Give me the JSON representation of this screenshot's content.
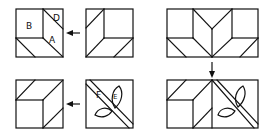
{
  "diagram": {
    "colors": {
      "line": "#111111",
      "background": "#ffffff"
    },
    "labels": {
      "B": "B",
      "D": "D",
      "A": "A",
      "F": "F",
      "E": "E"
    },
    "panels": [
      {
        "id": "top-left",
        "labels": [
          "B",
          "D",
          "A"
        ]
      },
      {
        "id": "top-middle",
        "labels": []
      },
      {
        "id": "top-right-wide",
        "labels": []
      },
      {
        "id": "bottom-left",
        "labels": []
      },
      {
        "id": "bottom-middle",
        "labels": [
          "F",
          "E"
        ]
      },
      {
        "id": "bottom-right-wide",
        "labels": []
      }
    ],
    "arrows": [
      {
        "from": "top-middle",
        "to": "top-left",
        "direction": "left"
      },
      {
        "from": "top-right-wide",
        "to": "bottom-right-wide",
        "direction": "down"
      },
      {
        "from": "bottom-middle",
        "to": "bottom-left",
        "direction": "left"
      }
    ]
  }
}
